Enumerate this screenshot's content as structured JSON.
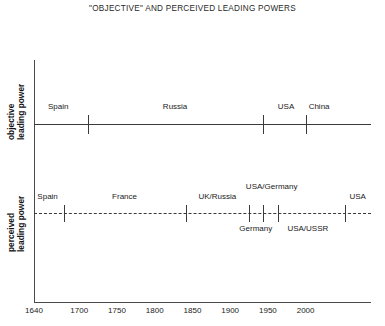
{
  "chart_data": {
    "type": "timeline",
    "title": "\"OBJECTIVE\" AND PERCEIVED LEADING POWERS",
    "xlabel": "",
    "xlim": [
      1640,
      2010
    ],
    "xticks": [
      1640,
      1700,
      1750,
      1800,
      1850,
      1900,
      1950,
      2000
    ],
    "xtick_labels": [
      "1640",
      "1700",
      "1750",
      "1800",
      "1850",
      "1900",
      "1950",
      "2000"
    ],
    "grid": false,
    "legend": "none",
    "series": [
      {
        "name": "objective leading power",
        "axis_label_lines": [
          "objective",
          "leading power"
        ],
        "line_style": "solid",
        "boundaries": [
          1712,
          1943,
          2000
        ],
        "segments": [
          {
            "label": "Spain",
            "start": 1640,
            "end": 1712,
            "center": 1672,
            "position": "above"
          },
          {
            "label": "Russia",
            "start": 1712,
            "end": 1943,
            "center": 1827,
            "position": "above"
          },
          {
            "label": "USA",
            "start": 1943,
            "end": 2000,
            "center": 1974,
            "position": "above"
          },
          {
            "label": "China",
            "start": 2000,
            "end": 2010,
            "center": 2004,
            "position": "above",
            "anchor": "left"
          }
        ]
      },
      {
        "name": "perceived leading power",
        "axis_label_lines": [
          "perceived",
          "leading power"
        ],
        "line_style": "dashed",
        "boundaries": [
          1680,
          1841,
          1925,
          1944,
          1964,
          2052
        ],
        "segments": [
          {
            "label": "Spain",
            "center": 1658,
            "position": "above"
          },
          {
            "label": "France",
            "center": 1760,
            "position": "above"
          },
          {
            "label": "UK/Russia",
            "center": 1883,
            "position": "above"
          },
          {
            "label": "USA/ Germany",
            "center": 1955,
            "position": "above",
            "lines": [
              "USA/",
              "Germany"
            ]
          },
          {
            "label": "USA",
            "center": 2058,
            "position": "above",
            "anchor": "left"
          },
          {
            "label": "Germany",
            "center": 1934,
            "position": "below"
          },
          {
            "label": "USA/USSR",
            "center": 2003,
            "position": "below"
          }
        ]
      }
    ]
  }
}
